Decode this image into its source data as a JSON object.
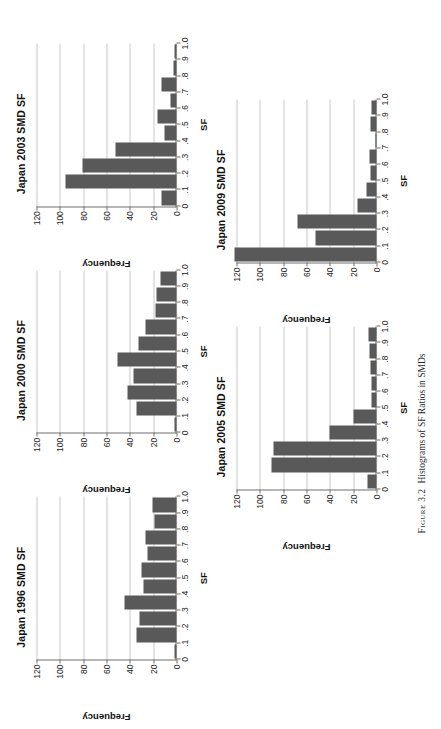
{
  "figure": {
    "number_label": "Figure 3.2",
    "caption_text": "Histograms of SF Ratios in SMDs"
  },
  "axis": {
    "ylabel": "Frequency",
    "xlabel": "SF",
    "y_ticks": [
      "120",
      "100",
      "80",
      "60",
      "40",
      "20",
      "0"
    ],
    "x_ticks": [
      "0",
      ".1",
      ".2",
      ".3",
      ".4",
      ".5",
      ".6",
      ".7",
      ".8",
      ".9",
      "1.0"
    ],
    "bar_color": "#595959",
    "grid_color": "#c9c9c9",
    "axis_color": "#6f6f6f"
  },
  "chart_data": [
    {
      "type": "bar",
      "title": "Japan 1996 SMD SF",
      "xlabel": "SF",
      "ylabel": "Frequency",
      "ylim": [
        0,
        120
      ],
      "xlim": [
        0,
        1.0
      ],
      "grid": true,
      "legend": "none",
      "categories": [
        "0-.1",
        ".1-.2",
        ".2-.3",
        ".3-.4",
        ".4-.5",
        ".5-.6",
        ".6-.7",
        ".7-.8",
        ".8-.9",
        ".9-1.0"
      ],
      "values": [
        2,
        34,
        32,
        45,
        28,
        30,
        25,
        27,
        19,
        21
      ]
    },
    {
      "type": "bar",
      "title": "Japan 2000 SMD SF",
      "xlabel": "SF",
      "ylabel": "Frequency",
      "ylim": [
        0,
        120
      ],
      "xlim": [
        0,
        1.0
      ],
      "grid": true,
      "legend": "none",
      "categories": [
        "0-.1",
        ".1-.2",
        ".2-.3",
        ".3-.4",
        ".4-.5",
        ".5-.6",
        ".6-.7",
        ".7-.8",
        ".8-.9",
        ".9-1.0"
      ],
      "values": [
        2,
        34,
        42,
        37,
        51,
        33,
        27,
        18,
        17,
        14
      ]
    },
    {
      "type": "bar",
      "title": "Japan 2003 SMD SF",
      "xlabel": "SF",
      "ylabel": "Frequency",
      "ylim": [
        0,
        120
      ],
      "xlim": [
        0,
        1.0
      ],
      "grid": true,
      "legend": "none",
      "categories": [
        "0-.1",
        ".1-.2",
        ".2-.3",
        ".3-.4",
        ".4-.5",
        ".5-.6",
        ".6-.7",
        ".7-.8",
        ".8-.9",
        ".9-1.0"
      ],
      "values": [
        13,
        95,
        81,
        52,
        10,
        16,
        5,
        13,
        3,
        2
      ]
    },
    {
      "type": "bar",
      "title": "Japan 2005 SMD SF",
      "xlabel": "SF",
      "ylabel": "Frequency",
      "ylim": [
        0,
        120
      ],
      "xlim": [
        0,
        1.0
      ],
      "grid": true,
      "legend": "none",
      "categories": [
        "0-.1",
        ".1-.2",
        ".2-.3",
        ".3-.4",
        ".4-.5",
        ".5-.6",
        ".6-.7",
        ".7-.8",
        ".8-.9",
        ".9-1.0"
      ],
      "values": [
        8,
        90,
        88,
        40,
        20,
        4,
        4,
        5,
        6,
        7
      ]
    },
    {
      "type": "bar",
      "title": "Japan 2009 SMD SF",
      "xlabel": "SF",
      "ylabel": "Frequency",
      "ylim": [
        0,
        120
      ],
      "xlim": [
        0,
        1.0
      ],
      "grid": true,
      "legend": "none",
      "categories": [
        "0-.1",
        ".1-.2",
        ".2-.3",
        ".3-.4",
        ".4-.5",
        ".5-.6",
        ".6-.7",
        ".7-.8",
        ".8-.9",
        ".9-1.0"
      ],
      "values": [
        122,
        52,
        68,
        16,
        9,
        5,
        6,
        1,
        5,
        4
      ]
    }
  ]
}
